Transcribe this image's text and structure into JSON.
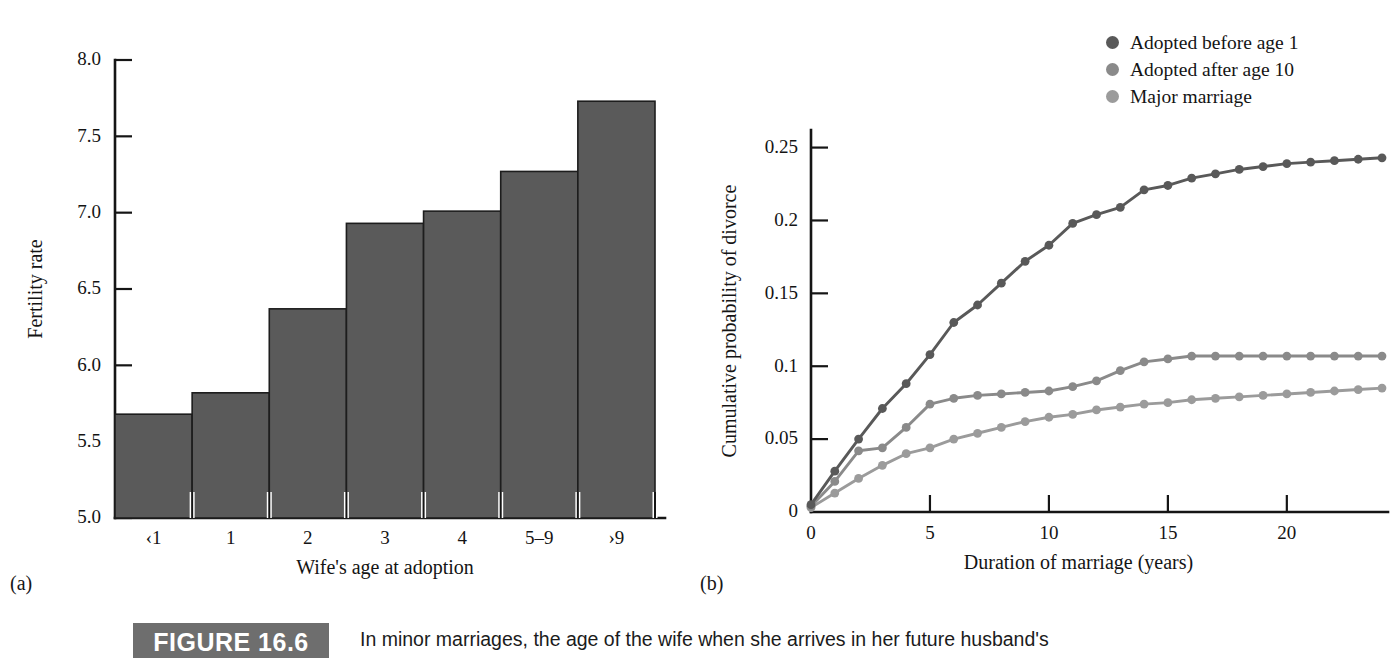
{
  "figure": {
    "badge_label": "FIGURE 16.6",
    "caption_text": "In minor marriages, the age of the wife when she arrives in her future husband's",
    "panel_a_letter": "(a)",
    "panel_b_letter": "(b)"
  },
  "colors": {
    "bar_fill": "#5a5a5a",
    "bar_stroke": "#1d1d1d",
    "axis": "#151515",
    "series_dark": "#595959",
    "series_mid": "#8a8a8a",
    "series_light": "#9b9b9b",
    "badge_bg": "#6e6e6e",
    "text": "#141414"
  },
  "chart_data": [
    {
      "id": "panel-a",
      "type": "bar",
      "title": "",
      "xlabel": "Wife's age at adoption",
      "ylabel": "Fertility rate",
      "categories": [
        "‹1",
        "1",
        "2",
        "3",
        "4",
        "5–9",
        "›9"
      ],
      "values": [
        5.68,
        5.82,
        6.37,
        6.93,
        7.01,
        7.27,
        7.73
      ],
      "ylim": [
        5.0,
        8.0
      ],
      "yticks": [
        5.0,
        5.5,
        6.0,
        6.5,
        7.0,
        7.5,
        8.0
      ],
      "ytick_labels": [
        "5.0",
        "5.5",
        "6.0",
        "6.5",
        "7.0",
        "7.5",
        "8.0"
      ],
      "grid": false,
      "legend": "none"
    },
    {
      "id": "panel-b",
      "type": "line",
      "title": "",
      "xlabel": "Duration of marriage (years)",
      "ylabel": "Cumulative probability of divorce",
      "xlim": [
        0,
        24
      ],
      "ylim": [
        0,
        0.26
      ],
      "xticks": [
        0,
        5,
        10,
        15,
        20
      ],
      "xtick_labels": [
        "0",
        "5",
        "10",
        "15",
        "20"
      ],
      "yticks": [
        0,
        0.05,
        0.1,
        0.15,
        0.2,
        0.25
      ],
      "ytick_labels": [
        "0",
        "0.05",
        "0.1",
        "0.15",
        "0.2",
        "0.25"
      ],
      "grid": false,
      "legend": "top-right",
      "x": [
        0,
        1,
        2,
        3,
        4,
        5,
        6,
        7,
        8,
        9,
        10,
        11,
        12,
        13,
        14,
        15,
        16,
        17,
        18,
        19,
        20,
        21,
        22,
        23,
        24
      ],
      "series": [
        {
          "name": "Adopted before age 1",
          "color": "#595959",
          "values": [
            0.005,
            0.028,
            0.05,
            0.071,
            0.088,
            0.108,
            0.13,
            0.142,
            0.157,
            0.172,
            0.183,
            0.198,
            0.204,
            0.209,
            0.221,
            0.224,
            0.229,
            0.232,
            0.235,
            0.237,
            0.239,
            0.24,
            0.241,
            0.242,
            0.243
          ]
        },
        {
          "name": "Adopted after age 10",
          "color": "#8a8a8a",
          "values": [
            0.004,
            0.021,
            0.042,
            0.044,
            0.058,
            0.074,
            0.078,
            0.08,
            0.081,
            0.082,
            0.083,
            0.086,
            0.09,
            0.097,
            0.103,
            0.105,
            0.107,
            0.107,
            0.107,
            0.107,
            0.107,
            0.107,
            0.107,
            0.107,
            0.107
          ]
        },
        {
          "name": "Major marriage",
          "color": "#9b9b9b",
          "values": [
            0.003,
            0.013,
            0.023,
            0.032,
            0.04,
            0.044,
            0.05,
            0.054,
            0.058,
            0.062,
            0.065,
            0.067,
            0.07,
            0.072,
            0.074,
            0.075,
            0.077,
            0.078,
            0.079,
            0.08,
            0.081,
            0.082,
            0.083,
            0.084,
            0.085
          ]
        }
      ]
    }
  ],
  "legend": {
    "items": [
      {
        "label": "Adopted before age 1",
        "color": "#595959"
      },
      {
        "label": "Adopted after age 10",
        "color": "#8a8a8a"
      },
      {
        "label": "Major marriage",
        "color": "#9b9b9b"
      }
    ]
  }
}
